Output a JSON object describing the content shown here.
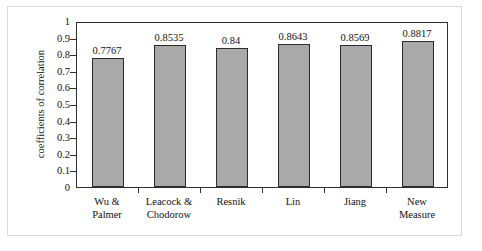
{
  "chart_data": {
    "type": "bar",
    "title": "",
    "xlabel": "",
    "ylabel": "coefficients of correlation",
    "ylim": [
      0,
      1
    ],
    "grid": false,
    "legend": false,
    "legend_position": "none",
    "categories": [
      "Wu & Palmer",
      "Leacock & Chodorow",
      "Resnik",
      "Lin",
      "Jiang",
      "New Measure"
    ],
    "category_lines": [
      [
        "Wu &",
        "Palmer"
      ],
      [
        "Leacock &",
        "Chodorow"
      ],
      [
        "Resnik"
      ],
      [
        "Lin"
      ],
      [
        "Jiang"
      ],
      [
        "New",
        "Measure"
      ]
    ],
    "values": [
      0.7767,
      0.8535,
      0.84,
      0.8643,
      0.8569,
      0.8817
    ],
    "value_labels": [
      "0.7767",
      "0.8535",
      "0.84",
      "0.8643",
      "0.8569",
      "0.8817"
    ],
    "ytick_labels": [
      "1",
      "0.9",
      "0.8",
      "0.7",
      "0.6",
      "0.5",
      "0.4",
      "0.3",
      "0.2",
      "0.1",
      "0"
    ],
    "ytick_values": [
      1,
      0.9,
      0.8,
      0.7,
      0.6,
      0.5,
      0.4,
      0.3,
      0.2,
      0.1,
      0
    ],
    "bar_fill_color": "#a9a9a9",
    "bar_border_color": "#2b2b2b",
    "axis_color": "#303030",
    "frame_color": "#d9d9d9",
    "background_color": "#ffffff"
  }
}
